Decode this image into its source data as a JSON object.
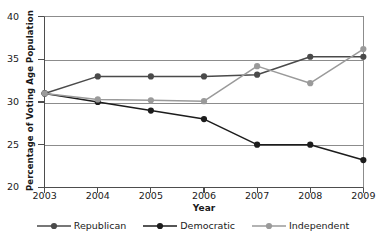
{
  "chart_data": {
    "type": "line",
    "title": "",
    "xlabel": "Year",
    "ylabel": "Percentage of Voting Age Population",
    "categories": [
      "2003",
      "2004",
      "2005",
      "2006",
      "2007",
      "2008",
      "2009"
    ],
    "x": [
      2003,
      2004,
      2005,
      2006,
      2007,
      2008,
      2009
    ],
    "xlim": [
      2003,
      2009
    ],
    "ylim": [
      20,
      40
    ],
    "yticks": [
      20,
      25,
      30,
      35,
      40
    ],
    "ytick_labels": [
      "20",
      "25",
      "30",
      "35",
      "40"
    ],
    "gridlines": [
      25,
      30,
      35
    ],
    "grid": true,
    "legend_position": "bottom",
    "series": [
      {
        "name": "Republican",
        "color": "#4a4a4a",
        "marker": "circle",
        "values": [
          31.0,
          33.0,
          33.0,
          33.0,
          33.2,
          35.3,
          35.3
        ]
      },
      {
        "name": "Democratic",
        "color": "#1c1c1c",
        "marker": "circle",
        "values": [
          31.0,
          30.0,
          29.0,
          28.0,
          25.0,
          25.0,
          23.2
        ]
      },
      {
        "name": "Independent",
        "color": "#9a9a9a",
        "marker": "circle",
        "values": [
          31.0,
          30.3,
          30.2,
          30.1,
          34.2,
          32.2,
          36.2
        ]
      }
    ]
  },
  "axis": {
    "y_title": "Percentage of Voting Age Population",
    "x_title": "Year"
  },
  "legend": {
    "items": [
      {
        "label": "Republican",
        "color": "#4a4a4a"
      },
      {
        "label": "Democratic",
        "color": "#1c1c1c"
      },
      {
        "label": "Independent",
        "color": "#9a9a9a"
      }
    ]
  }
}
